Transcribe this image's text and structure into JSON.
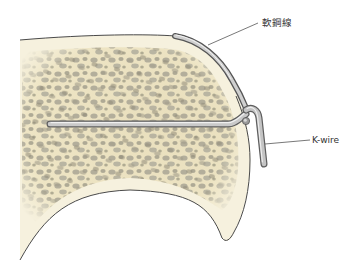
{
  "figure": {
    "labels": {
      "soft_wire": "軟鋼線",
      "k_wire": "K-wire"
    },
    "colors": {
      "cortex": "#f6f1de",
      "cancellous": "#efe7c8",
      "pores": "#a9a594",
      "outline": "#4a4a4a",
      "wire_light": "#e0e0e0",
      "wire_mid": "#a8a8a8",
      "wire_dark": "#5e5e5e",
      "leader": "#555555"
    }
  }
}
